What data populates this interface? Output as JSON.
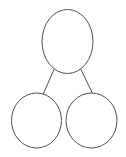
{
  "diagram": {
    "type": "number-bond",
    "background_color": "#ffffff",
    "stroke_color": "#4f4f4f",
    "fill_color": "#ffffff",
    "stroke_width": 1,
    "canvas": {
      "width": 126,
      "height": 157
    },
    "nodes": [
      {
        "id": "whole",
        "role": "whole",
        "label": "",
        "shape": "ellipse",
        "cx": 67.5,
        "cy": 41.5,
        "rx": 25.5,
        "ry": 32
      },
      {
        "id": "part-left",
        "role": "part",
        "label": "",
        "shape": "ellipse",
        "cx": 36.5,
        "cy": 120.5,
        "rx": 25,
        "ry": 27.5
      },
      {
        "id": "part-right",
        "role": "part",
        "label": "",
        "shape": "ellipse",
        "cx": 91.5,
        "cy": 120.5,
        "rx": 25.5,
        "ry": 27.5
      }
    ],
    "links": [
      {
        "id": "link-left",
        "from": "whole",
        "to": "part-left",
        "x1": 54,
        "y1": 69.5,
        "x2": 43,
        "y2": 94.5
      },
      {
        "id": "link-right",
        "from": "whole",
        "to": "part-right",
        "x1": 81,
        "y1": 69.5,
        "x2": 93,
        "y2": 94.5
      }
    ]
  }
}
